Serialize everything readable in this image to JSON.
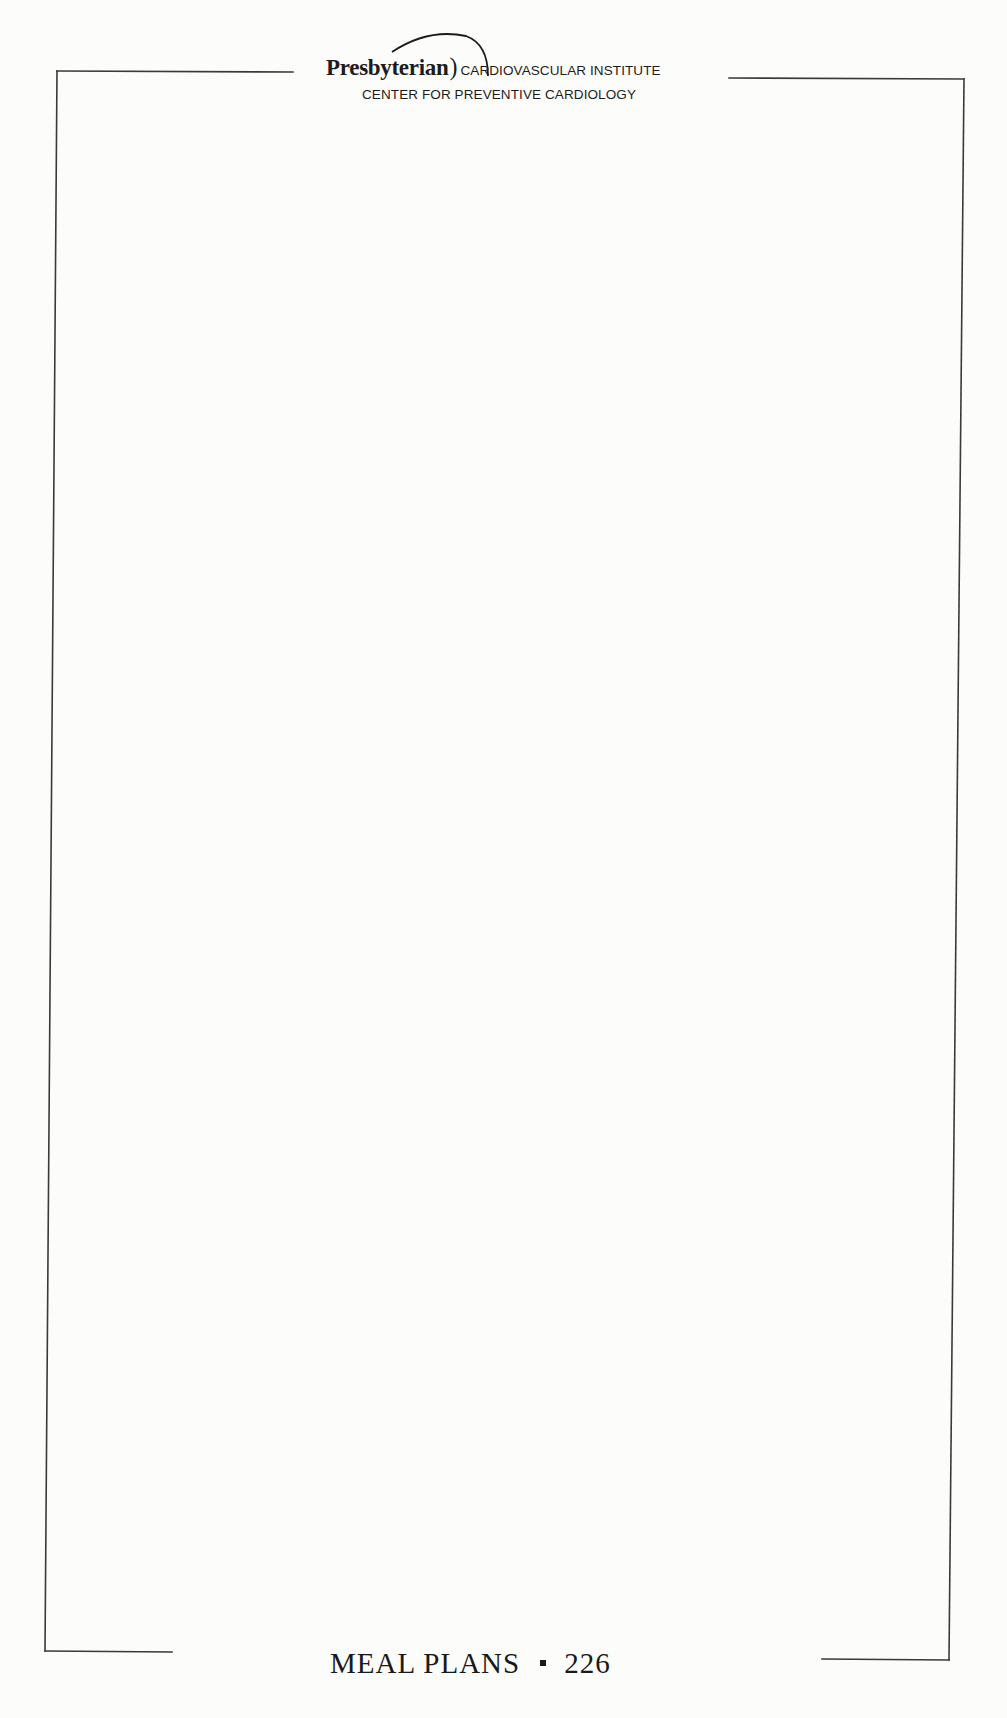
{
  "header": {
    "organization": "Presbyterian",
    "institute": "CARDIOVASCULAR INSTITUTE",
    "center": "CENTER FOR PREVENTIVE CARDIOLOGY"
  },
  "body": {
    "content": ""
  },
  "footer": {
    "section": "MEAL PLANS",
    "page_number": "226"
  },
  "colors": {
    "ink": "#1a1a1a",
    "paper": "#fcfcfb"
  }
}
